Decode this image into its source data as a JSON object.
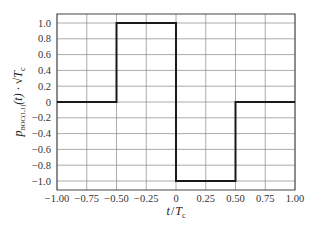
{
  "chart_data": {
    "type": "line",
    "title": "",
    "xlabel": "t / T_c",
    "ylabel": "p_BOC(1,1)(t) · √T_c",
    "xlim": [
      -1.0,
      1.0
    ],
    "ylim": [
      -1.1,
      1.1
    ],
    "grid": true,
    "legend": "none",
    "x_ticks": [
      "-1.00",
      "-0.75",
      "-0.50",
      "-0.25",
      "0",
      "0.25",
      "0.50",
      "0.75",
      "1.00"
    ],
    "y_ticks": [
      "1.0",
      "0.8",
      "0.6",
      "0.4",
      "0.2",
      "0",
      "-0.2",
      "-0.4",
      "-0.6",
      "-0.8",
      "-1.0"
    ],
    "series": [
      {
        "name": "BOC(1,1) spreading waveform",
        "x": [
          -1.0,
          -0.5,
          -0.5,
          0.0,
          0.0,
          0.5,
          0.5,
          1.0
        ],
        "y": [
          0,
          0,
          1,
          1,
          -1,
          -1,
          0,
          0
        ]
      }
    ]
  },
  "labels": {
    "xlabel_t": "t",
    "xlabel_slash": "/",
    "xlabel_T": "T",
    "xlabel_sub": "c",
    "ylabel_p": "p",
    "ylabel_sub": "BOC(1,1)",
    "ylabel_rest": "(t) · √T",
    "ylabel_rest_sub": "c"
  }
}
